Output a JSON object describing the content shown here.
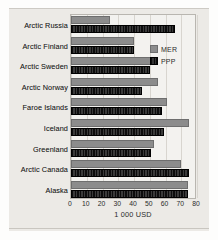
{
  "chart_data": {
    "type": "bar",
    "orientation": "horizontal",
    "title": "",
    "xlabel": "1 000 USD",
    "ylabel": "",
    "xlim": [
      0,
      80
    ],
    "xticks": [
      0,
      10,
      20,
      30,
      40,
      50,
      60,
      70,
      80
    ],
    "xtick_labels": [
      "0",
      "10",
      "20",
      "30",
      "40",
      "50",
      "60",
      "70",
      "80"
    ],
    "grid": true,
    "grid_axis": "x",
    "legend_position": "upper right",
    "categories": [
      "Arctic Russia",
      "Arctic Finland",
      "Arctic Sweden",
      "Arctic Norway",
      "Faroe Islands",
      "Iceland",
      "Greenland",
      "Arctic Canada",
      "Alaska"
    ],
    "series": [
      {
        "name": "MER",
        "color": "#8c8c8c",
        "values": [
          25,
          40,
          51,
          55,
          61,
          75,
          53,
          70,
          74
        ]
      },
      {
        "name": "PPP",
        "color": "#141414",
        "values": [
          66,
          40,
          50,
          45,
          58,
          59,
          51,
          75,
          74
        ]
      }
    ]
  },
  "legend": {
    "items": [
      {
        "label": "MER"
      },
      {
        "label": "PPP"
      }
    ]
  },
  "axis": {
    "x_title": "1 000 USD"
  }
}
